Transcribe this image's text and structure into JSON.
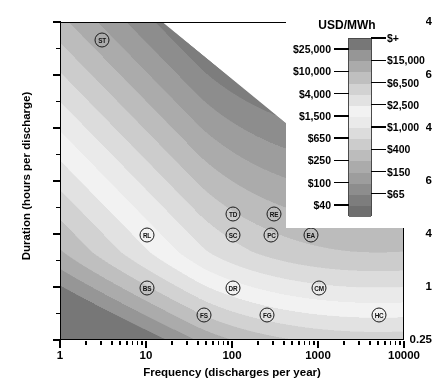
{
  "chart_data": {
    "type": "heatmap",
    "title": "",
    "xlabel": "Frequency (discharges per year)",
    "ylabel": "Duration (hours per discharge)",
    "xscale": "log",
    "yscale": "log",
    "xlim": [
      1,
      10000
    ],
    "ylim": [
      0.25,
      1024
    ],
    "xticks": [
      "1",
      "10",
      "100",
      "1000",
      "10000"
    ],
    "yticks": [
      "0.25",
      "1",
      "4",
      "16",
      "64",
      "256",
      "1024"
    ],
    "grid": false,
    "colorbar": {
      "title": "USD/MWh",
      "unit": "USD/MWh",
      "levels_left": [
        "$25,000",
        "$10,000",
        "$4,000",
        "$1,500",
        "$650",
        "$250",
        "$100",
        "$40"
      ],
      "levels_right": [
        "$+",
        "$15,000",
        "$6,500",
        "$2,500",
        "$1,000",
        "$400",
        "$150",
        "$65"
      ],
      "boundaries": [
        "$40",
        "$65",
        "$100",
        "$150",
        "$250",
        "$400",
        "$650",
        "$1,000",
        "$1,500",
        "$2,500",
        "$4,000",
        "$6,500",
        "$10,000",
        "$15,000",
        "$25,000",
        "$+"
      ],
      "band_colors": [
        "#6f6f6f",
        "#7d7d7d",
        "#8d8d8d",
        "#9d9d9d",
        "#ababab",
        "#bcbcbc",
        "#cccccc",
        "#dcdcdc",
        "#eaeaea",
        "#f2f2f2",
        "#e2e2e2",
        "#d2d2d2",
        "#bfbfbf",
        "#ababab",
        "#969696",
        "#777777"
      ],
      "orientation": "vertical"
    },
    "technologies": [
      {
        "code": "ST",
        "x": 3.0,
        "y": 660.0
      },
      {
        "code": "RL",
        "x": 10.0,
        "y": 4.0
      },
      {
        "code": "BS",
        "x": 10.0,
        "y": 1.0
      },
      {
        "code": "TD",
        "x": 100.0,
        "y": 7.0
      },
      {
        "code": "SC",
        "x": 100.0,
        "y": 4.0
      },
      {
        "code": "DR",
        "x": 100.0,
        "y": 1.0
      },
      {
        "code": "FS",
        "x": 46.0,
        "y": 0.5
      },
      {
        "code": "RE",
        "x": 300.0,
        "y": 7.0
      },
      {
        "code": "PC",
        "x": 280.0,
        "y": 4.0
      },
      {
        "code": "FG",
        "x": 250.0,
        "y": 0.5
      },
      {
        "code": "EA",
        "x": 800.0,
        "y": 4.0
      },
      {
        "code": "CM",
        "x": 1000.0,
        "y": 1.0
      },
      {
        "code": "HC",
        "x": 5000.0,
        "y": 0.5
      }
    ],
    "contour_note": "Levelized cost bands decreasing from upper-left/lower-left toward the light diagonal ridge, then increasing again toward lower-right."
  },
  "axes": {
    "x_ticks": [
      {
        "label": "1",
        "value": 1
      },
      {
        "label": "10",
        "value": 10
      },
      {
        "label": "100",
        "value": 100
      },
      {
        "label": "1000",
        "value": 1000
      },
      {
        "label": "10000",
        "value": 10000
      }
    ],
    "y_ticks": [
      {
        "label": "0.25",
        "value": 0.25
      },
      {
        "label": "1",
        "value": 1
      },
      {
        "label": "4",
        "value": 4
      },
      {
        "label": "16",
        "value": 16
      },
      {
        "label": "64",
        "value": 64
      },
      {
        "label": "256",
        "value": 256
      },
      {
        "label": "1024",
        "value": 1024
      }
    ]
  }
}
